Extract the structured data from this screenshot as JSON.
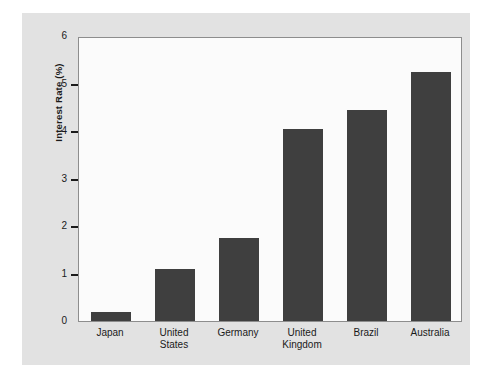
{
  "chart_data": {
    "type": "bar",
    "title": "",
    "xlabel": "",
    "ylabel": "Interest Rate (%)",
    "categories": [
      "Japan",
      "United States",
      "Germany",
      "United Kingdom",
      "Brazil",
      "Australia"
    ],
    "category_lines": [
      [
        "Japan"
      ],
      [
        "United",
        "States"
      ],
      [
        "Germany"
      ],
      [
        "United",
        "Kingdom"
      ],
      [
        "Brazil"
      ],
      [
        "Australia"
      ]
    ],
    "values": [
      0.2,
      1.1,
      1.75,
      4.05,
      4.45,
      5.25
    ],
    "ylim": [
      0,
      6
    ],
    "yticks": [
      0,
      1,
      2,
      3,
      4,
      5,
      6
    ],
    "ytick_labels": [
      "0",
      "1",
      "2",
      "3",
      "4",
      "5",
      "6"
    ],
    "grid": false,
    "legend": null,
    "bar_color": "#3f3f3f",
    "plot_background": "#fbfbfb",
    "figure_background": "#e2e2e2",
    "axis_color": "#1a1a1a"
  }
}
